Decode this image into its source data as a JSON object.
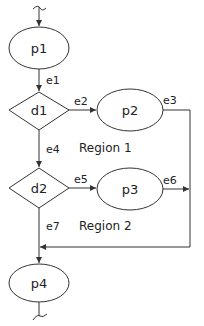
{
  "diagram": {
    "type": "control-flow-graph",
    "colors": {
      "stroke": "#333333",
      "text": "#222222",
      "background": "#ffffff"
    },
    "nodes": [
      {
        "id": "p1",
        "label": "p1",
        "shape": "ellipse"
      },
      {
        "id": "d1",
        "label": "d1",
        "shape": "diamond"
      },
      {
        "id": "p2",
        "label": "p2",
        "shape": "ellipse"
      },
      {
        "id": "d2",
        "label": "d2",
        "shape": "diamond"
      },
      {
        "id": "p3",
        "label": "p3",
        "shape": "ellipse"
      },
      {
        "id": "p4",
        "label": "p4",
        "shape": "ellipse"
      }
    ],
    "edges": [
      {
        "id": "e1",
        "label": "e1",
        "from": "p1",
        "to": "d1"
      },
      {
        "id": "e2",
        "label": "e2",
        "from": "d1",
        "to": "p2"
      },
      {
        "id": "e3",
        "label": "e3",
        "from": "p2",
        "to": "p4"
      },
      {
        "id": "e4",
        "label": "e4",
        "from": "d1",
        "to": "d2"
      },
      {
        "id": "e5",
        "label": "e5",
        "from": "d2",
        "to": "p3"
      },
      {
        "id": "e6",
        "label": "e6",
        "from": "p3",
        "to": "p4"
      },
      {
        "id": "e7",
        "label": "e7",
        "from": "d2",
        "to": "p4"
      }
    ],
    "regions": [
      {
        "id": "region1",
        "label": "Region 1"
      },
      {
        "id": "region2",
        "label": "Region 2"
      }
    ]
  }
}
